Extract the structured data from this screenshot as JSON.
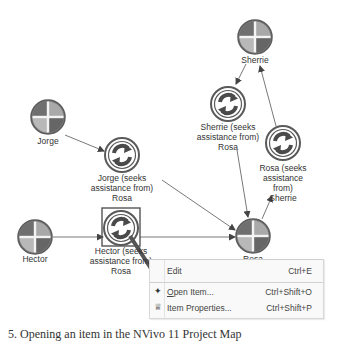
{
  "map": {
    "nodes": [
      {
        "id": "sherrie",
        "type": "case",
        "label": "Sherrie",
        "cx": 255,
        "cy": 37
      },
      {
        "id": "sherrie-seeks",
        "type": "relationship",
        "label": "Sherrie (seeks\nassistance from)\nRosa",
        "cx": 228,
        "cy": 104
      },
      {
        "id": "rosa-seeks",
        "type": "relationship",
        "label": "Rosa (seeks\nassistance from)\nSherrie",
        "cx": 283,
        "cy": 143
      },
      {
        "id": "jorge",
        "type": "case",
        "label": "Jorge",
        "cx": 48,
        "cy": 117
      },
      {
        "id": "jorge-seeks",
        "type": "relationship",
        "label": "Jorge (seeks\nassistance from)\nRosa",
        "cx": 122,
        "cy": 155
      },
      {
        "id": "hector",
        "type": "case",
        "label": "Hector",
        "cx": 35,
        "cy": 237
      },
      {
        "id": "hector-seeks",
        "type": "relationship",
        "label": "Hector (seeks\nassistance from)\nRosa",
        "cx": 121,
        "cy": 228,
        "selected": true
      },
      {
        "id": "rosa",
        "type": "case",
        "label": "Rosa",
        "cx": 253,
        "cy": 236
      }
    ],
    "labels": {
      "sherrie": "Sherrie",
      "sherrie_seeks": "Sherrie (seeks\nassistance from)\nRosa",
      "rosa_seeks": "Rosa (seeks\nassistance from)\nSherrie",
      "jorge": "Jorge",
      "jorge_seeks": "Jorge (seeks\nassistance from)\nRosa",
      "hector": "Hector",
      "hector_seeks": "Hector (seeks\nassistance from)\nRosa",
      "rosa": "Rosa"
    },
    "colors": {
      "case_dark": "#6f6f6f",
      "case_light": "#b4b4b4",
      "case_ring": "#5a5a5a",
      "relationship_ring": "#5a5a5a",
      "edge": "#555555",
      "pointer_arrow": "#555555"
    }
  },
  "context_menu": {
    "items": [
      {
        "label": "Edit",
        "shortcut": "Ctrl+E",
        "icon": "none"
      },
      {
        "label": "Open Item...",
        "shortcut": "Ctrl+Shift+O",
        "icon": "open-item-icon",
        "mnemonic": "O"
      },
      {
        "label": "Item Properties...",
        "shortcut": "Ctrl+Shift+P",
        "icon": "item-properties-icon",
        "mnemonic": "i"
      }
    ]
  },
  "caption": {
    "text": "5. Opening an item in the NVivo 11 Project Map"
  }
}
